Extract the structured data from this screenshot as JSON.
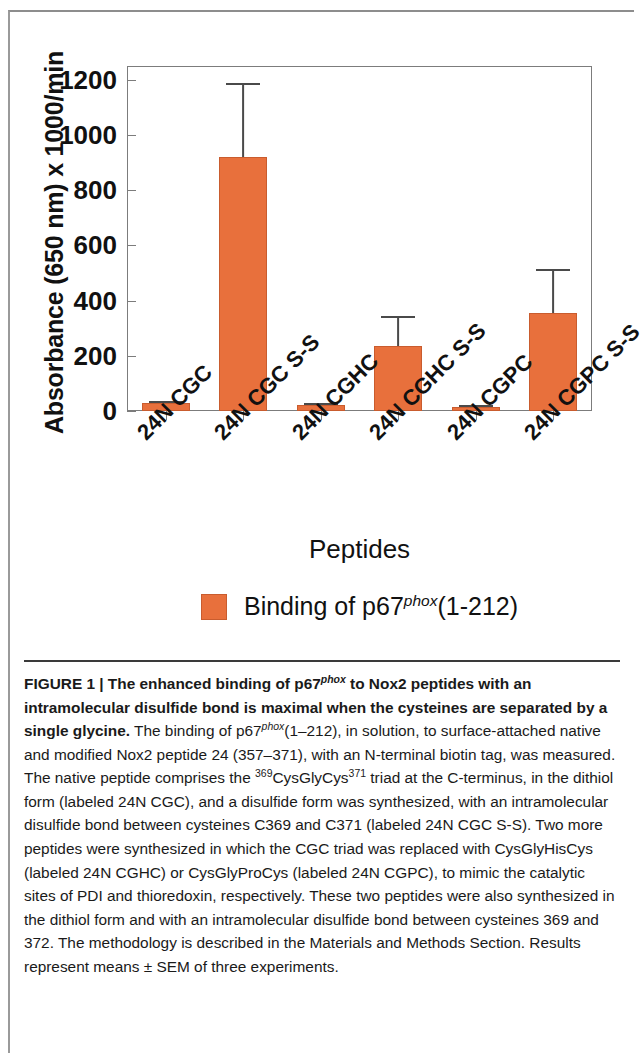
{
  "chart_data": {
    "type": "bar",
    "title": "",
    "xlabel": "Peptides",
    "ylabel": "Absorbance (650 nm) x 1000/min",
    "ylim": [
      0,
      1250
    ],
    "yticks": [
      0,
      200,
      400,
      600,
      800,
      1000,
      1200
    ],
    "grid": false,
    "legend_position": "bottom-center",
    "categories": [
      "24N CGC",
      "24N CGC S-S",
      "24N CGHC",
      "24N CGHC S-S",
      "24N CGPC",
      "24N CGPC S-S"
    ],
    "series": [
      {
        "name": "Binding of p67phox(1-212)",
        "color": "#e8703c",
        "values": [
          30,
          920,
          22,
          235,
          15,
          355
        ],
        "errors": [
          8,
          270,
          7,
          110,
          5,
          160
        ]
      }
    ],
    "legend": [
      {
        "swatch_color": "#e8703c",
        "text_prefix": "Binding of p67",
        "text_sup": "phox",
        "text_suffix": "(1-212)"
      }
    ]
  },
  "axis": {
    "y_title": "Absorbance (650 nm) x 1000/min",
    "x_title": "Peptides",
    "y_tick_labels": [
      "1200",
      "1000",
      "800",
      "600",
      "400",
      "200",
      "0"
    ]
  },
  "caption": {
    "figure_label": "FIGURE 1 |",
    "bold_title": " The enhanced binding of p67",
    "bold_title_sup": "phox",
    "bold_title_2": " to Nox2 peptides with an intramolecular disulfide bond is maximal when the cysteines are separated by a single glycine.",
    "body_1": " The binding of p67",
    "body_sup_1": "phox",
    "body_2": "(1–212), in solution, to surface-attached native and modified Nox2 peptide 24 (357–371), with an N-terminal biotin tag, was measured. The native peptide comprises the ",
    "body_sup_2": "369",
    "body_3": "CysGlyCys",
    "body_sup_3": "371",
    "body_4": " triad at the C-terminus, in the dithiol form (labeled 24N CGC), and a disulfide form was synthesized, with an intramolecular disulfide bond between cysteines C369 and C371 (labeled 24N CGC S-S). Two more peptides were synthesized in which the CGC triad was replaced with CysGlyHisCys (labeled 24N CGHC) or CysGlyProCys (labeled 24N CGPC), to mimic the catalytic sites of PDI and thioredoxin, respectively. These two peptides were also synthesized in the dithiol form and with an intramolecular disulfide bond between cysteines 369 and 372. The methodology is described in the Materials and Methods Section. Results represent means ± SEM of three experiments."
  }
}
